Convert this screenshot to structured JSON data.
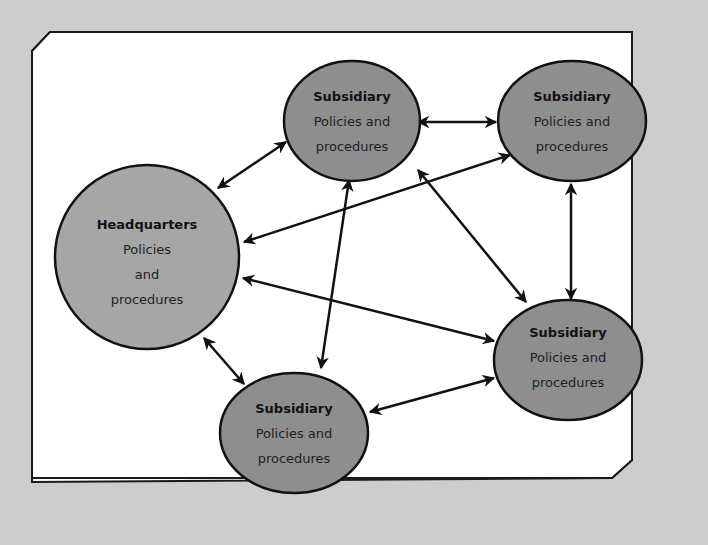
{
  "diagram": {
    "colors": {
      "page_background": "#cdcdcd",
      "panel_background": "#ffffff",
      "node_fill": "#8e8e8e",
      "hq_fill": "#a6a6a6",
      "stroke": "#111111"
    },
    "nodes": [
      {
        "id": "hq",
        "title": "Headquarters",
        "lines": [
          "Policies",
          "and",
          "procedures"
        ]
      },
      {
        "id": "sub_top",
        "title": "Subsidiary",
        "lines": [
          "Policies and",
          "procedures"
        ]
      },
      {
        "id": "sub_top_right",
        "title": "Subsidiary",
        "lines": [
          "Policies and",
          "procedures"
        ]
      },
      {
        "id": "sub_right",
        "title": "Subsidiary",
        "lines": [
          "Policies and",
          "procedures"
        ]
      },
      {
        "id": "sub_bottom",
        "title": "Subsidiary",
        "lines": [
          "Policies and",
          "procedures"
        ]
      }
    ],
    "edges": [
      {
        "from": "hq",
        "to": "sub_top",
        "bidirectional": true
      },
      {
        "from": "hq",
        "to": "sub_top_right",
        "bidirectional": true
      },
      {
        "from": "hq",
        "to": "sub_right",
        "bidirectional": true
      },
      {
        "from": "hq",
        "to": "sub_bottom",
        "bidirectional": true
      },
      {
        "from": "sub_top",
        "to": "sub_top_right",
        "bidirectional": true
      },
      {
        "from": "sub_top",
        "to": "sub_right",
        "bidirectional": true
      },
      {
        "from": "sub_top",
        "to": "sub_bottom",
        "bidirectional": true
      },
      {
        "from": "sub_top_right",
        "to": "sub_right",
        "bidirectional": true
      },
      {
        "from": "sub_bottom",
        "to": "sub_right",
        "bidirectional": true
      }
    ]
  }
}
